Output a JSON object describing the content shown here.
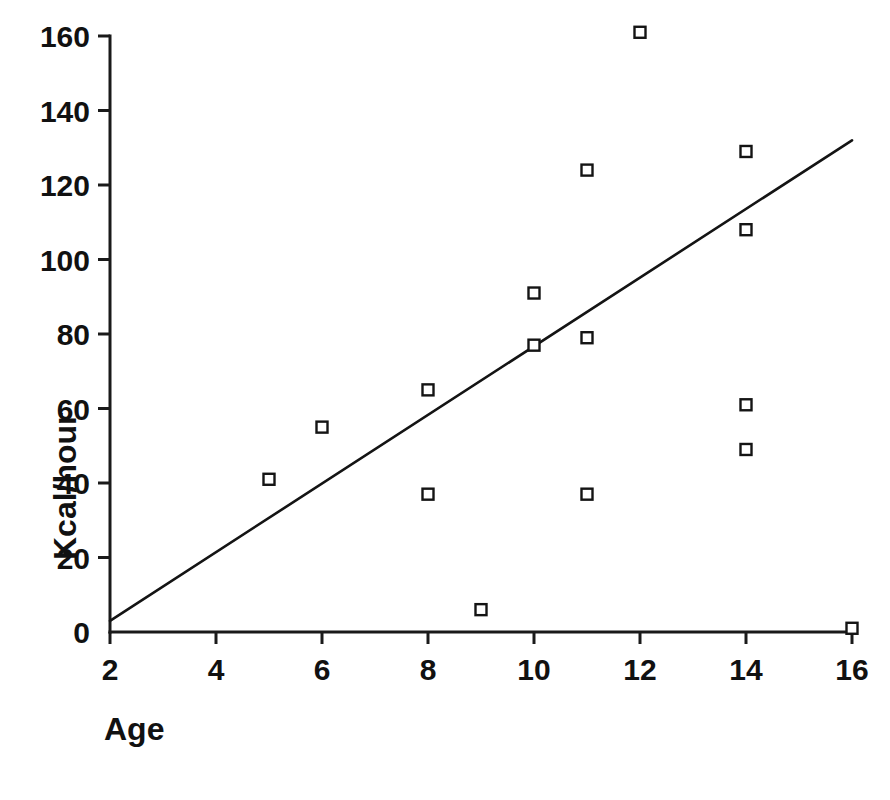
{
  "figure": {
    "background_color": "#ffffff",
    "ink_color": "#141414",
    "marker_style": "open-square"
  },
  "chart_data": {
    "type": "scatter",
    "title": "",
    "subtitle": "",
    "xlabel": "Age",
    "ylabel": "Kcal/hour",
    "xlim": [
      2,
      16
    ],
    "ylim": [
      0,
      160
    ],
    "xticks": [
      2,
      4,
      6,
      8,
      10,
      12,
      14,
      16
    ],
    "xtick_labels": [
      "2",
      "4",
      "6",
      "8",
      "10",
      "12",
      "14",
      "16"
    ],
    "yticks": [
      0,
      20,
      40,
      60,
      80,
      100,
      120,
      140,
      160
    ],
    "ytick_labels": [
      "0",
      "20",
      "40",
      "60",
      "80",
      "100",
      "120",
      "140",
      "160"
    ],
    "grid": false,
    "legend": "none",
    "legend_position": "none",
    "series": [
      {
        "name": "observations",
        "marker": "open-square",
        "x": [
          5,
          6,
          8,
          8,
          9,
          10,
          10,
          11,
          11,
          11,
          12,
          14,
          14,
          14,
          14,
          16
        ],
        "y": [
          41,
          55,
          65,
          37,
          6,
          91,
          77,
          124,
          79,
          37,
          161,
          129,
          108,
          61,
          49,
          1
        ],
        "points": [
          {
            "x": 5,
            "y": 41
          },
          {
            "x": 6,
            "y": 55
          },
          {
            "x": 8,
            "y": 65
          },
          {
            "x": 8,
            "y": 37
          },
          {
            "x": 9,
            "y": 6
          },
          {
            "x": 10,
            "y": 91
          },
          {
            "x": 10,
            "y": 77
          },
          {
            "x": 11,
            "y": 124
          },
          {
            "x": 11,
            "y": 79
          },
          {
            "x": 11,
            "y": 37
          },
          {
            "x": 12,
            "y": 161
          },
          {
            "x": 14,
            "y": 129
          },
          {
            "x": 14,
            "y": 108
          },
          {
            "x": 14,
            "y": 61
          },
          {
            "x": 14,
            "y": 49
          },
          {
            "x": 16,
            "y": 1
          }
        ]
      }
    ],
    "trendline": {
      "name": "regression-line",
      "type": "linear",
      "x_start": 2,
      "y_start": 3,
      "x_end": 16,
      "y_end": 132
    }
  }
}
